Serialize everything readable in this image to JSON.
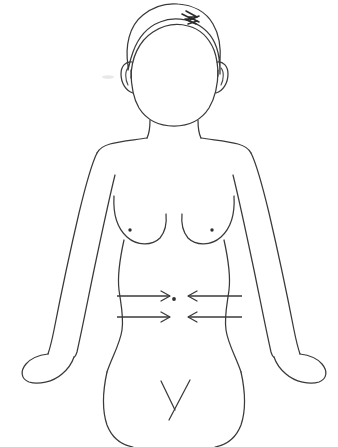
{
  "figure": {
    "caption": "Outline drawing of a female upper body, front view, with four horizontal arrows pointing inward toward the navel",
    "view": "anterior",
    "subject": "female upper body",
    "background_color": "#ffffff",
    "line_color": "#3a3a3a",
    "width_px": 338,
    "height_px": 447
  },
  "annotations": {
    "navel_marker": "navel-dot",
    "nipple_markers": [
      "left-nipple-dot",
      "right-nipple-dot"
    ],
    "hair_part": "hair-part-scribble"
  },
  "arrows": {
    "direction": "inward",
    "target": "navel",
    "count": 4,
    "items": [
      {
        "name": "arrow-left-upper",
        "points": "right",
        "x_start": 117,
        "x_end": 170,
        "y": 296
      },
      {
        "name": "arrow-left-lower",
        "points": "right",
        "x_start": 117,
        "x_end": 170,
        "y": 317
      },
      {
        "name": "arrow-right-upper",
        "points": "left",
        "x_start": 242,
        "x_end": 188,
        "y": 296
      },
      {
        "name": "arrow-right-lower",
        "points": "left",
        "x_start": 242,
        "x_end": 188,
        "y": 317
      }
    ]
  },
  "body_parts": [
    "hair-outline",
    "hairline",
    "left-ear",
    "right-ear",
    "face-outline",
    "neck",
    "left-shoulder",
    "right-shoulder",
    "left-arm",
    "right-arm",
    "left-hand",
    "right-hand",
    "left-breast",
    "right-breast",
    "torso-left-side",
    "torso-right-side",
    "left-hip",
    "right-hip",
    "groin-lines"
  ]
}
